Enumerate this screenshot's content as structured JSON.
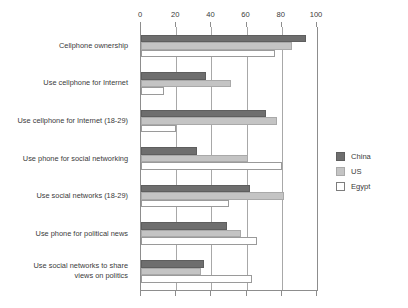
{
  "chart_data": {
    "type": "bar",
    "orientation": "horizontal",
    "title": "",
    "subtitle": "",
    "xlabel": "",
    "ylabel": "",
    "xlim": [
      0,
      100
    ],
    "xticks": [
      0,
      20,
      40,
      60,
      80,
      100
    ],
    "xtick_labels": [
      "0",
      "20",
      "40",
      "60",
      "80",
      "100"
    ],
    "grid": true,
    "grid_axis": "x",
    "axis_position": "top",
    "legend_position": "right",
    "categories": [
      "Cellphone ownership",
      "Use cellphone for Internet",
      "Use cellphone for Internet (18-29)",
      "Use phone for social networking",
      "Use social networks (18-29)",
      "Use phone for political news",
      "Use social networks to share\nviews on politics"
    ],
    "series": [
      {
        "name": "China",
        "color": "#6e6e6e",
        "values": [
          94,
          37,
          71,
          32,
          62,
          49,
          36
        ]
      },
      {
        "name": "US",
        "color": "#c4c4c4",
        "values": [
          86,
          51,
          77,
          61,
          81,
          57,
          34
        ]
      },
      {
        "name": "Egypt",
        "color": "#ffffff",
        "values": [
          76,
          13,
          20,
          80,
          50,
          66,
          63
        ]
      }
    ]
  },
  "legend": {
    "entries": [
      {
        "label": "China",
        "swatch": "china-swatch"
      },
      {
        "label": "US",
        "swatch": "us-swatch"
      },
      {
        "label": "Egypt",
        "swatch": "egypt-swatch"
      }
    ]
  },
  "colors": {
    "china": "#6e6e6e",
    "us": "#c4c4c4",
    "egypt": "#ffffff",
    "axis": "#8d8d8d",
    "grid": "#a8a8a8",
    "text": "#3a3a3a",
    "background": "#ffffff"
  }
}
